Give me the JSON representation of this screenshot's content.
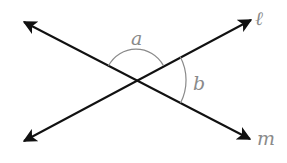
{
  "diagram": {
    "type": "intersecting-lines-angles",
    "intersection": {
      "x": 136,
      "y": 80
    },
    "lines": [
      {
        "name": "l",
        "label": "ℓ",
        "from": {
          "x": 24,
          "y": 141
        },
        "to": {
          "x": 251,
          "y": 20
        },
        "arrows": "both"
      },
      {
        "name": "m",
        "label": "m",
        "from": {
          "x": 24,
          "y": 22
        },
        "to": {
          "x": 250,
          "y": 139
        },
        "arrows": "both"
      }
    ],
    "angles": [
      {
        "name": "a",
        "label": "a",
        "between": "top"
      },
      {
        "name": "b",
        "label": "b",
        "between": "right"
      }
    ],
    "colors": {
      "line": "#111111",
      "arc": "#8a8a8a",
      "label": "#8a8a8a"
    }
  }
}
